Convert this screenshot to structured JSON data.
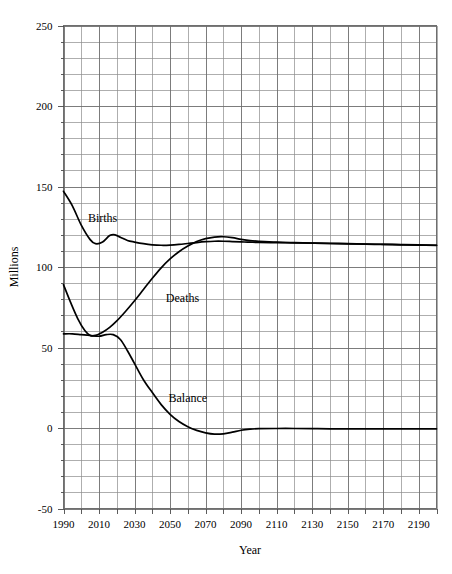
{
  "chart_data": {
    "type": "line",
    "title": "",
    "xlabel": "Year",
    "ylabel": "Millions",
    "xlim": [
      1990,
      2200
    ],
    "ylim": [
      -50,
      250
    ],
    "grid": true,
    "grid_major_x_step": 20,
    "grid_minor_x_step": 10,
    "grid_major_y_step": 50,
    "grid_minor_y_step": 10,
    "legend_position": "inline-annotations",
    "x_tick_labels": [
      "1990",
      "2010",
      "2030",
      "2050",
      "2070",
      "2090",
      "2110",
      "2130",
      "2150",
      "2170",
      "2190"
    ],
    "x_tick_values": [
      1990,
      2010,
      2030,
      2050,
      2070,
      2090,
      2110,
      2130,
      2150,
      2170,
      2190
    ],
    "y_tick_labels": [
      "250",
      "200",
      "150",
      "100",
      "50",
      "0",
      "-50"
    ],
    "y_tick_values": [
      250,
      200,
      150,
      100,
      50,
      0,
      -50
    ],
    "annotations": [
      {
        "text": "Births",
        "x": 2012,
        "y": 128
      },
      {
        "text": "Deaths",
        "x": 2057,
        "y": 78
      },
      {
        "text": "Balance",
        "x": 2060,
        "y": 16
      }
    ],
    "series": [
      {
        "name": "Births",
        "label": "Births",
        "color": "#000000",
        "x": [
          1990,
          1995,
          2000,
          2005,
          2008,
          2012,
          2016,
          2019,
          2022,
          2026,
          2030,
          2035,
          2040,
          2045,
          2050,
          2055,
          2060,
          2065,
          2070,
          2075,
          2080,
          2085,
          2090,
          2095,
          2100,
          2110,
          2120,
          2130,
          2140,
          2150,
          2160,
          2170,
          2180,
          2190,
          2200
        ],
        "values": [
          147.0,
          138.0,
          126.0,
          117.0,
          114.5,
          115.5,
          119.5,
          120.0,
          118.5,
          116.5,
          115.5,
          114.5,
          113.8,
          113.5,
          113.6,
          114.0,
          114.6,
          115.2,
          115.7,
          116.0,
          116.0,
          115.8,
          115.6,
          115.4,
          115.3,
          115.1,
          115.0,
          114.8,
          114.6,
          114.4,
          114.2,
          114.0,
          113.8,
          113.6,
          113.4
        ]
      },
      {
        "name": "Deaths",
        "label": "Deaths",
        "color": "#000000",
        "x": [
          1990,
          1994,
          1998,
          2002,
          2005,
          2008,
          2012,
          2016,
          2020,
          2025,
          2030,
          2035,
          2040,
          2045,
          2050,
          2055,
          2060,
          2065,
          2070,
          2075,
          2080,
          2085,
          2090,
          2095,
          2100,
          2110,
          2120,
          2130,
          2140,
          2150,
          2160,
          2170,
          2180,
          2190,
          2200
        ],
        "values": [
          89.0,
          78.0,
          68.0,
          60.5,
          57.5,
          57.5,
          59.5,
          62.5,
          66.5,
          72.5,
          79.0,
          86.0,
          93.0,
          99.5,
          105.0,
          109.5,
          113.0,
          115.8,
          117.6,
          118.6,
          118.8,
          118.2,
          117.2,
          116.4,
          116.0,
          115.4,
          115.1,
          114.9,
          114.7,
          114.5,
          114.3,
          114.1,
          113.9,
          113.7,
          113.5
        ]
      },
      {
        "name": "Balance",
        "label": "Balance",
        "color": "#000000",
        "x": [
          1990,
          1995,
          2000,
          2005,
          2010,
          2014,
          2018,
          2022,
          2026,
          2030,
          2035,
          2040,
          2045,
          2050,
          2055,
          2060,
          2065,
          2070,
          2075,
          2080,
          2085,
          2090,
          2095,
          2100,
          2110,
          2120,
          2130,
          2140,
          2150,
          2160,
          2170,
          2180,
          2190,
          2200
        ],
        "values": [
          58.5,
          58.5,
          58.0,
          57.5,
          57.0,
          58.0,
          58.0,
          55.0,
          48.0,
          40.0,
          30.0,
          22.0,
          14.5,
          8.5,
          4.0,
          0.8,
          -1.5,
          -3.0,
          -3.8,
          -3.6,
          -2.6,
          -1.4,
          -0.7,
          -0.4,
          -0.3,
          -0.3,
          -0.4,
          -0.5,
          -0.5,
          -0.5,
          -0.5,
          -0.5,
          -0.5,
          -0.5
        ]
      }
    ]
  },
  "axes": {
    "x_title": "Year",
    "y_title": "Millions"
  }
}
